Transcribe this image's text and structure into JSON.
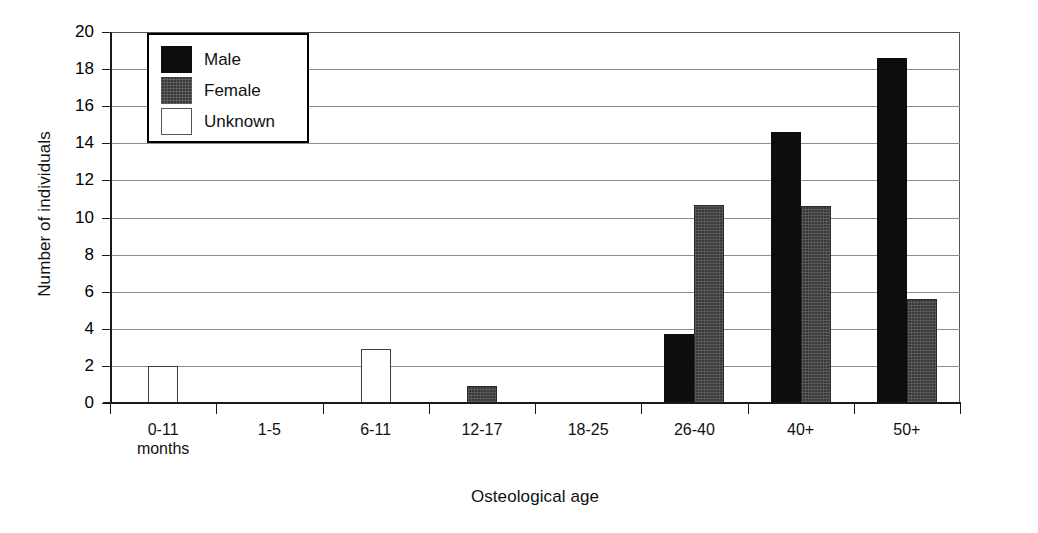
{
  "chart_data": {
    "type": "bar",
    "title": "",
    "xlabel": "Osteological age",
    "ylabel": "Number of individuals",
    "categories": [
      "0-11\nmonths",
      "1-5",
      "6-11",
      "12-17",
      "18-25",
      "26-40",
      "40+",
      "50+"
    ],
    "series": [
      {
        "name": "Male",
        "color": "#0d0d0d",
        "values": [
          0,
          0,
          0,
          0,
          0,
          3.7,
          14.6,
          18.6
        ]
      },
      {
        "name": "Female",
        "color": "#3a3a3a",
        "values": [
          0,
          0,
          0,
          0.9,
          0,
          10.7,
          10.6,
          5.6
        ]
      },
      {
        "name": "Unknown",
        "color": "#ffffff",
        "values": [
          2.0,
          0,
          2.9,
          0,
          0,
          0,
          0,
          0
        ]
      }
    ],
    "ylim": [
      0,
      20
    ],
    "yticks": [
      0,
      2,
      4,
      6,
      8,
      10,
      12,
      14,
      16,
      18,
      20
    ],
    "ytick_labels": [
      "0",
      "2",
      "4",
      "6",
      "8",
      "10",
      "12",
      "14",
      "16",
      "18",
      "20"
    ],
    "grid": "horizontal",
    "legend_position": "top-left",
    "legend_entries": [
      "Male",
      "Female",
      "Unknown"
    ]
  },
  "axis": {
    "y_title": "Number of individuals",
    "x_title": "Osteological age"
  },
  "legend": {
    "items": [
      {
        "label": "Male",
        "swatch": "male-swatch"
      },
      {
        "label": "Female",
        "swatch": "female-swatch"
      },
      {
        "label": "Unknown",
        "swatch": "unknown-swatch"
      }
    ]
  },
  "categories": [
    {
      "line1": "0-11",
      "line2": "months"
    },
    {
      "line1": "1-5",
      "line2": ""
    },
    {
      "line1": "6-11",
      "line2": ""
    },
    {
      "line1": "12-17",
      "line2": ""
    },
    {
      "line1": "18-25",
      "line2": ""
    },
    {
      "line1": "26-40",
      "line2": ""
    },
    {
      "line1": "40+",
      "line2": ""
    },
    {
      "line1": "50+",
      "line2": ""
    }
  ]
}
